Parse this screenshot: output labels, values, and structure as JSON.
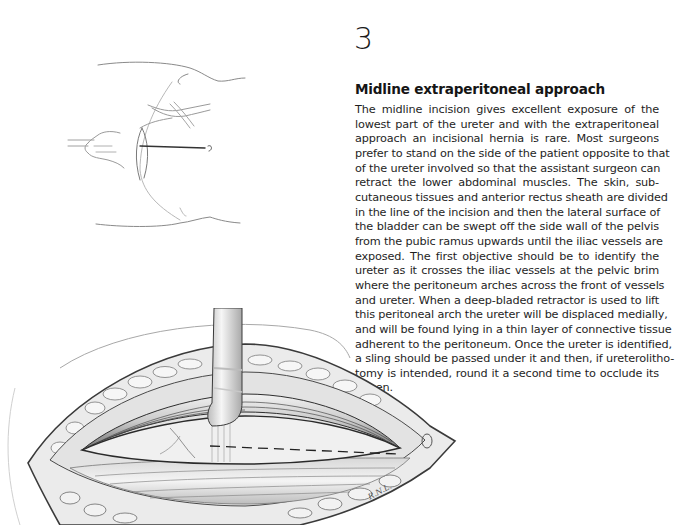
{
  "page": {
    "chapter_number": "3",
    "section_heading": "Midline extraperitoneal approach",
    "body_lines": [
      "The midline incision gives excellent exposure of the",
      "lowest part of the ureter and with the extraperitoneal",
      "approach an incisional hernia is rare. Most surgeons",
      "prefer to stand on the side of the patient opposite to that",
      "of the ureter involved so that the assistant surgeon can",
      "retract the lower abdominal muscles. The skin, sub-",
      "cutaneous tissues and anterior rectus sheath are divided",
      "in the line of the incision and then the lateral surface of",
      "the bladder can be swept off the side wall of the pelvis",
      "from the pubic ramus upwards until the iliac vessels are",
      "exposed. The first objective should be to identify the",
      "ureter as it crosses the iliac vessels at the pelvic brim",
      "where the peritoneum arches across the front of vessels",
      "and ureter. When a deep-bladed retractor is used to lift",
      "this peritoneal arch the ureter will be displaced medially,",
      "and will be found lying in a thin layer of connective tissue",
      "adherent to the peritoneum. Once the ureter is identified,",
      "a sling should be passed under it and then, if ureterolitho-",
      "tomy is intended, round it a second time to occlude its",
      "lumen."
    ]
  },
  "figures": {
    "top": {
      "description": "Orientation sketch: patient outline with lower midline incision line"
    },
    "bottom": {
      "description": "Operative view: retracted rectus muscles with sling under ureter, dashed incision on bladder wall"
    },
    "artist_signature": "R.N.L."
  }
}
